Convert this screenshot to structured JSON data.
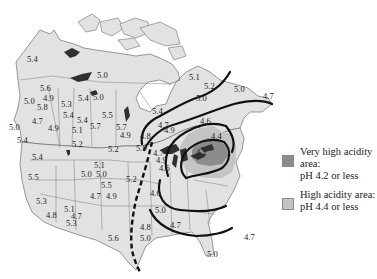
{
  "map": {
    "title": "Acid rain pH across North America",
    "colors": {
      "land": "#e2e2e2",
      "border": "#6e6e6e",
      "water": "#ffffff",
      "lakes": "#303030",
      "very_high": "#8c8c8c",
      "high": "#bdbdbd",
      "isoline": "#111111"
    },
    "labels": [
      {
        "text": "5.4",
        "x": 27,
        "y": 62
      },
      {
        "text": "5.0",
        "x": 97,
        "y": 78
      },
      {
        "text": "5.6",
        "x": 40,
        "y": 91
      },
      {
        "text": "4.9",
        "x": 43,
        "y": 101
      },
      {
        "text": "5.0",
        "x": 24,
        "y": 104
      },
      {
        "text": "5.8",
        "x": 37,
        "y": 110
      },
      {
        "text": "5.3",
        "x": 61,
        "y": 107
      },
      {
        "text": "5.4",
        "x": 78,
        "y": 101
      },
      {
        "text": "5.0",
        "x": 93,
        "y": 100
      },
      {
        "text": "5.4",
        "x": 63,
        "y": 118
      },
      {
        "text": "5.4",
        "x": 77,
        "y": 123
      },
      {
        "text": "5.5",
        "x": 102,
        "y": 118
      },
      {
        "text": "4.7",
        "x": 32,
        "y": 124
      },
      {
        "text": "5.0",
        "x": 9,
        "y": 130
      },
      {
        "text": "4.9",
        "x": 48,
        "y": 131
      },
      {
        "text": "5.1",
        "x": 72,
        "y": 133
      },
      {
        "text": "5.7",
        "x": 90,
        "y": 129
      },
      {
        "text": "5.4",
        "x": 17,
        "y": 143
      },
      {
        "text": "5.4",
        "x": 152,
        "y": 114
      },
      {
        "text": "5.7",
        "x": 116,
        "y": 130
      },
      {
        "text": "4.9",
        "x": 120,
        "y": 138
      },
      {
        "text": "4.7",
        "x": 158,
        "y": 128
      },
      {
        "text": "4.9",
        "x": 164,
        "y": 133
      },
      {
        "text": "4.8",
        "x": 140,
        "y": 139
      },
      {
        "text": "5.1",
        "x": 189,
        "y": 80
      },
      {
        "text": "5.2",
        "x": 204,
        "y": 89
      },
      {
        "text": "5.0",
        "x": 234,
        "y": 92
      },
      {
        "text": "5.0",
        "x": 196,
        "y": 101
      },
      {
        "text": "4.7",
        "x": 263,
        "y": 99
      },
      {
        "text": "4.6",
        "x": 200,
        "y": 124
      },
      {
        "text": "4.4",
        "x": 211,
        "y": 139
      },
      {
        "text": "4.2",
        "x": 196,
        "y": 155
      },
      {
        "text": "5.2",
        "x": 72,
        "y": 147
      },
      {
        "text": "5.2",
        "x": 108,
        "y": 152
      },
      {
        "text": "5.0",
        "x": 136,
        "y": 151
      },
      {
        "text": "4.7",
        "x": 153,
        "y": 156
      },
      {
        "text": "4.9",
        "x": 156,
        "y": 163
      },
      {
        "text": "4.6",
        "x": 159,
        "y": 171
      },
      {
        "text": "5.4",
        "x": 32,
        "y": 160
      },
      {
        "text": "5.1",
        "x": 94,
        "y": 168
      },
      {
        "text": "5.0",
        "x": 81,
        "y": 177
      },
      {
        "text": "5.0",
        "x": 96,
        "y": 177
      },
      {
        "text": "5.2",
        "x": 126,
        "y": 182
      },
      {
        "text": "5.5",
        "x": 28,
        "y": 180
      },
      {
        "text": "5.5",
        "x": 101,
        "y": 188
      },
      {
        "text": "4.7",
        "x": 90,
        "y": 199
      },
      {
        "text": "4.9",
        "x": 106,
        "y": 199
      },
      {
        "text": "4.6",
        "x": 150,
        "y": 196
      },
      {
        "text": "5.3",
        "x": 36,
        "y": 204
      },
      {
        "text": "5.1",
        "x": 64,
        "y": 212
      },
      {
        "text": "4.7",
        "x": 71,
        "y": 219
      },
      {
        "text": "4.8",
        "x": 46,
        "y": 218
      },
      {
        "text": "5.0",
        "x": 155,
        "y": 213
      },
      {
        "text": "5.3",
        "x": 66,
        "y": 226
      },
      {
        "text": "4.8",
        "x": 140,
        "y": 230
      },
      {
        "text": "4.7",
        "x": 170,
        "y": 228
      },
      {
        "text": "5.6",
        "x": 108,
        "y": 241
      },
      {
        "text": "5.0",
        "x": 140,
        "y": 241
      },
      {
        "text": "4.7",
        "x": 244,
        "y": 240
      },
      {
        "text": "5.0",
        "x": 207,
        "y": 257
      }
    ]
  },
  "legend": {
    "items": [
      {
        "line1": "Very high acidity area:",
        "line2": "pH 4.2 or less",
        "color": "#8c8c8c"
      },
      {
        "line1": "High acidity area:",
        "line2": "pH 4.4 or less",
        "color": "#c4c4c4"
      }
    ]
  }
}
